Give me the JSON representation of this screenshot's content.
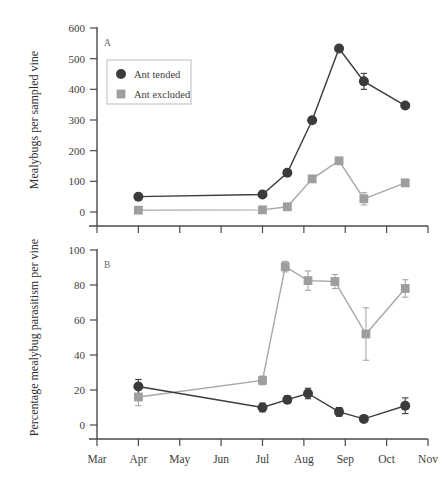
{
  "figure": {
    "panel_a_label": "A",
    "panel_b_label": "B",
    "legend": {
      "items": [
        {
          "label": "Ant tended",
          "marker": "circle",
          "color": "#3b3b3b"
        },
        {
          "label": "Ant excluded",
          "marker": "square",
          "color": "#9e9e9e"
        }
      ]
    },
    "colors": {
      "ant_tended": "#3b3b3b",
      "ant_excluded": "#9e9e9e",
      "axis": "#4a4a4a",
      "background": "#ffffff"
    }
  },
  "chart_data": [
    {
      "type": "line",
      "panel": "A",
      "title": "",
      "xlabel": "",
      "ylabel": "Mealybugs per sampled vine",
      "ylim": [
        0,
        600
      ],
      "yticks": [
        0,
        100,
        200,
        300,
        400,
        500,
        600
      ],
      "xlim": [
        0,
        8
      ],
      "xticks": [
        0,
        1,
        2,
        3,
        4,
        5,
        6,
        7,
        8
      ],
      "xticklabels": [
        "Mar",
        "Apr",
        "May",
        "Jun",
        "Jul",
        "Aug",
        "Sep",
        "Oct",
        "Nov"
      ],
      "grid": false,
      "legend_position": "upper-left",
      "series": [
        {
          "name": "Ant tended",
          "marker": "circle",
          "color": "#3b3b3b",
          "x": [
            1.0,
            4.0,
            4.6,
            5.2,
            5.85,
            6.45,
            7.45
          ],
          "values": [
            50,
            57,
            128,
            299,
            533,
            426,
            347
          ],
          "errors": [
            0,
            0,
            0,
            0,
            0,
            26,
            0
          ]
        },
        {
          "name": "Ant excluded",
          "marker": "square",
          "color": "#9e9e9e",
          "x": [
            1.0,
            4.0,
            4.6,
            5.2,
            5.85,
            6.45,
            7.45
          ],
          "values": [
            6,
            7,
            17,
            108,
            167,
            43,
            95
          ],
          "errors": [
            0,
            0,
            0,
            0,
            0,
            20,
            0
          ]
        }
      ]
    },
    {
      "type": "line",
      "panel": "B",
      "title": "",
      "xlabel": "",
      "ylabel": "Percentage mealybug parasitism per vine",
      "ylim": [
        0,
        100
      ],
      "yticks": [
        0,
        20,
        40,
        60,
        80,
        100
      ],
      "xlim": [
        0,
        8
      ],
      "xticks": [
        0,
        1,
        2,
        3,
        4,
        5,
        6,
        7,
        8
      ],
      "xticklabels": [
        "Mar",
        "Apr",
        "May",
        "Jun",
        "Jul",
        "Aug",
        "Sep",
        "Oct",
        "Nov"
      ],
      "grid": false,
      "legend_position": "none",
      "series": [
        {
          "name": "Ant tended",
          "marker": "circle",
          "color": "#3b3b3b",
          "x": [
            1.0,
            4.0,
            4.6,
            5.1,
            5.85,
            6.45,
            7.45
          ],
          "values": [
            22,
            10,
            14.5,
            18,
            7.5,
            3.5,
            11
          ],
          "errors": [
            4,
            2.5,
            2,
            3,
            2.5,
            1.5,
            4.5
          ]
        },
        {
          "name": "Ant excluded",
          "marker": "square",
          "color": "#9e9e9e",
          "x": [
            1.0,
            4.0,
            4.55,
            5.1,
            5.75,
            6.5,
            7.45
          ],
          "values": [
            16,
            25.5,
            90.5,
            82.5,
            82,
            52,
            78
          ],
          "errors": [
            5,
            2.5,
            3,
            5.5,
            4,
            15,
            5
          ]
        }
      ]
    }
  ]
}
